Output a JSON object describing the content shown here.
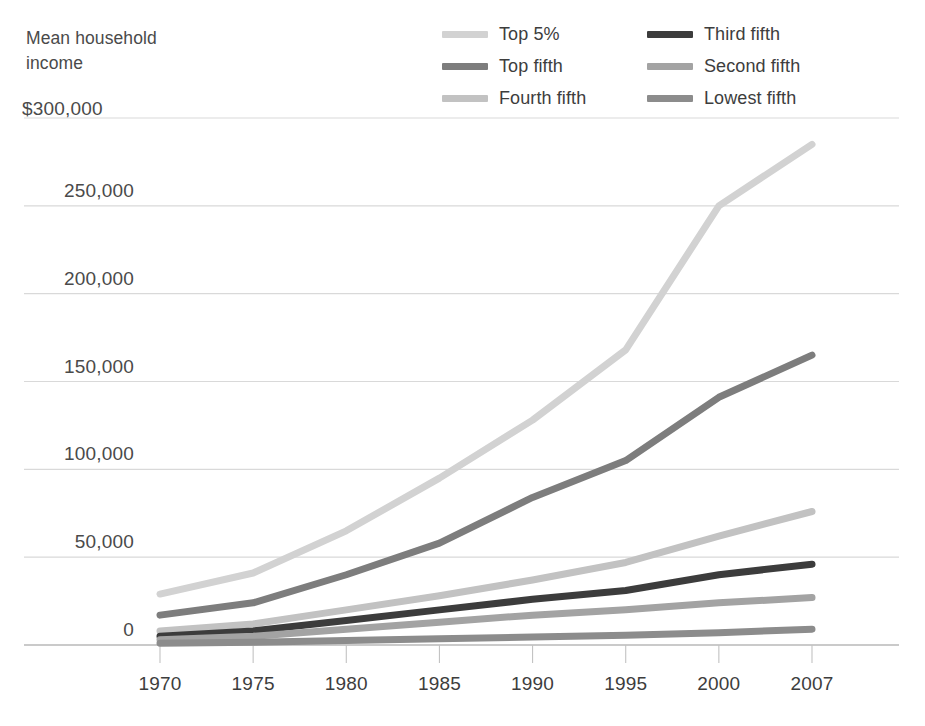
{
  "axis_title": "Mean household\nincome",
  "y_top_label": "$300,000",
  "legend": {
    "items": [
      {
        "label": "Top 5%",
        "color": "#d2d2d2",
        "key": "top5"
      },
      {
        "label": "Third fifth",
        "color": "#3c3c3c",
        "key": "third"
      },
      {
        "label": "Top fifth",
        "color": "#7d7d7d",
        "key": "topfifth"
      },
      {
        "label": "Second fifth",
        "color": "#a3a3a3",
        "key": "second"
      },
      {
        "label": "Fourth fifth",
        "color": "#c2c2c2",
        "key": "fourth"
      },
      {
        "label": "Lowest fifth",
        "color": "#8c8c8c",
        "key": "lowest"
      }
    ]
  },
  "chart_data": {
    "type": "line",
    "title": "Mean household income",
    "xlabel": "",
    "ylabel": "Mean household income",
    "ylim": [
      0,
      300000
    ],
    "xlim": [
      1970,
      2007
    ],
    "grid": true,
    "legend_position": "top-right",
    "x": [
      1970,
      1975,
      1980,
      1985,
      1990,
      1995,
      2000,
      2007
    ],
    "x_tick_labels": [
      "1970",
      "1975",
      "1980",
      "1985",
      "1990",
      "1995",
      "2000",
      "2007"
    ],
    "y_ticks": [
      0,
      50000,
      100000,
      150000,
      200000,
      250000,
      300000
    ],
    "y_tick_labels": [
      "0",
      "50,000",
      "100,000",
      "150,000",
      "200,000",
      "250,000",
      "$300,000"
    ],
    "series": [
      {
        "name": "Top 5%",
        "color": "#d2d2d2",
        "values": [
          29000,
          41000,
          65000,
          95000,
          128000,
          168000,
          250000,
          285000
        ]
      },
      {
        "name": "Top fifth",
        "color": "#7d7d7d",
        "values": [
          17000,
          24000,
          40000,
          58000,
          84000,
          105000,
          141000,
          165000
        ]
      },
      {
        "name": "Fourth fifth",
        "color": "#c2c2c2",
        "values": [
          8000,
          12000,
          20000,
          28000,
          37000,
          47000,
          62000,
          76000
        ]
      },
      {
        "name": "Third fifth",
        "color": "#3c3c3c",
        "values": [
          5000,
          8000,
          14000,
          20000,
          26000,
          31000,
          40000,
          46000
        ]
      },
      {
        "name": "Second fifth",
        "color": "#a3a3a3",
        "values": [
          3000,
          5000,
          9000,
          13000,
          17000,
          20000,
          24000,
          27000
        ]
      },
      {
        "name": "Lowest fifth",
        "color": "#8c8c8c",
        "values": [
          1000,
          1500,
          2500,
          3500,
          4500,
          5500,
          7000,
          9000
        ]
      }
    ]
  },
  "geometry": {
    "plot_left": 160,
    "plot_right": 812,
    "y_zero": 645,
    "y_top": 118,
    "y_max_value": 300000
  }
}
